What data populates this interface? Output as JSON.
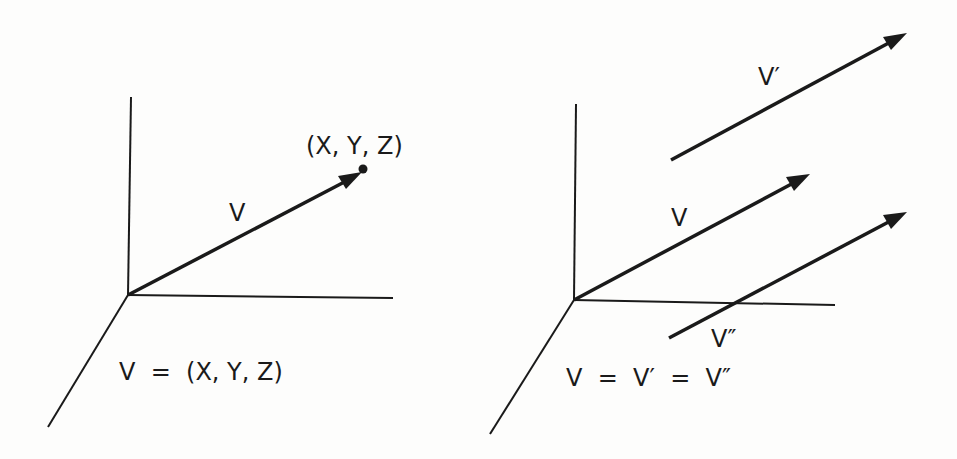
{
  "left_panel": {
    "point_label": "(X, Y, Z)",
    "vector_label": "V",
    "equation": "V  =  (X, Y, Z)"
  },
  "right_panel": {
    "vector_prime_label": "V′",
    "vector_label": "V",
    "vector_double_prime_label": "V″",
    "equation": "V  =  V′  =  V″"
  },
  "colors": {
    "ink": "#1a1a1a",
    "paper": "#fdfdfc"
  }
}
